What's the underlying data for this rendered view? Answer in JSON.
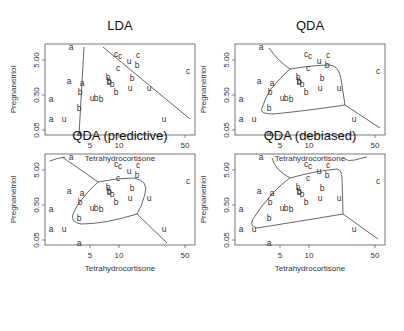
{
  "chart_data": [
    {
      "type": "scatter",
      "title": "LDA",
      "xlabel": "Tetrahydrocortisone",
      "ylabel": "Pregnanetriol",
      "xscale": "log",
      "yscale": "log",
      "xticks": [
        "5",
        "10",
        "50"
      ],
      "yticks": [
        "0.05",
        "0.50",
        "5.00"
      ],
      "xlim": [
        1.7,
        63
      ],
      "ylim": [
        0.04,
        14
      ],
      "boundary_type": "linear"
    },
    {
      "type": "scatter",
      "title": "QDA",
      "xlabel": "Tetrahydrocortisone",
      "ylabel": "Pregnanetriol",
      "xscale": "log",
      "yscale": "log",
      "xticks": [
        "5",
        "10",
        "50"
      ],
      "yticks": [
        "0.05",
        "0.50",
        "5.00"
      ],
      "boundary_type": "quadratic"
    },
    {
      "type": "scatter",
      "title": "QDA (predictive)",
      "xlabel": "Tetrahydrocortisone",
      "ylabel": "Pregnanetriol",
      "xscale": "log",
      "yscale": "log",
      "xticks": [
        "5",
        "10",
        "50"
      ],
      "yticks": [
        "0.05",
        "0.50",
        "5.00"
      ],
      "boundary_type": "quadratic-predictive"
    },
    {
      "type": "scatter",
      "title": "QDA (debiased)",
      "xlabel": "Tetrahydrocortisone",
      "ylabel": "Pregnanetriol",
      "xscale": "log",
      "yscale": "log",
      "xticks": [
        "5",
        "10",
        "50"
      ],
      "yticks": [
        "0.05",
        "0.50",
        "5.00"
      ],
      "boundary_type": "quadratic-debiased"
    }
  ],
  "points": [
    {
      "l": "a",
      "x": 26,
      "y": 3
    },
    {
      "l": "a",
      "x": 24,
      "y": 37
    },
    {
      "l": "a",
      "x": 37,
      "y": 39
    },
    {
      "l": "b",
      "x": 35,
      "y": 48
    },
    {
      "l": "a",
      "x": 6,
      "y": 55
    },
    {
      "l": "b",
      "x": 34,
      "y": 64
    },
    {
      "l": "a",
      "x": 6,
      "y": 75
    },
    {
      "l": "u",
      "x": 19,
      "y": 75
    },
    {
      "l": "a",
      "x": 34,
      "y": 89
    },
    {
      "l": "u",
      "x": 47,
      "y": 54
    },
    {
      "l": "b",
      "x": 51,
      "y": 54
    },
    {
      "l": "b",
      "x": 56,
      "y": 55
    },
    {
      "l": "b",
      "x": 63,
      "y": 33
    },
    {
      "l": "b",
      "x": 64,
      "y": 37
    },
    {
      "l": "b",
      "x": 64,
      "y": 38
    },
    {
      "l": "b",
      "x": 67,
      "y": 40
    },
    {
      "l": "b",
      "x": 71,
      "y": 48
    },
    {
      "l": "c",
      "x": 71,
      "y": 10
    },
    {
      "l": "c",
      "x": 75,
      "y": 12
    },
    {
      "l": "u",
      "x": 84,
      "y": 17
    },
    {
      "l": "c",
      "x": 93,
      "y": 11
    },
    {
      "l": "b",
      "x": 92,
      "y": 21
    },
    {
      "l": "c",
      "x": 73,
      "y": 24
    },
    {
      "l": "b",
      "x": 87,
      "y": 34
    },
    {
      "l": "u",
      "x": 85,
      "y": 44
    },
    {
      "l": "u",
      "x": 104,
      "y": 44
    },
    {
      "l": "c",
      "x": 143,
      "y": 27
    },
    {
      "l": "u",
      "x": 119,
      "y": 75
    }
  ],
  "panels": [
    {
      "title": "LDA",
      "ox": 45,
      "oy": 44,
      "paths": [
        "M 39 3 L 34 91",
        "M 58 3 L 145 75"
      ]
    },
    {
      "title": "QDA",
      "ox": 235,
      "oy": 44,
      "paths": [
        "M 34 4 Q 44 18 55 25",
        "M 55 25 Q 80 21 95 21 Q 104 22 106 35 L 110 61 Q 70 67 38 70 Q 24 70 27 64 Q 30 55 35 46 Q 45 34 55 25",
        "M 110 61 L 145 84"
      ]
    },
    {
      "title": "QDA (predictive)",
      "ox": 45,
      "oy": 154,
      "paths": [
        "M 5 7 Q 12 4 20 3",
        "M 17 3 Q 35 15 53 28",
        "M 53 28 Q 72 24 88 24 Q 104 26 100 40 Q 97 52 92 60 Q 60 70 36 70 Q 25 68 28 60 Q 32 50 38 44 Q 45 35 53 28",
        "M 92 60 L 122 89"
      ]
    },
    {
      "title": "QDA (debiased)",
      "ox": 235,
      "oy": 154,
      "paths": [
        "M 37 4 Q 40 16 55 24",
        "M 55 24 Q 80 17 102 15 Q 107 16 107 24 L 108 60 Q 60 68 22 74 Q 14 72 18 65 Q 26 52 38 39 Q 46 30 55 24",
        "M 108 60 L 143 85",
        "M 108 4 Q 113 8 120 6 Q 126 4 132 3"
      ]
    }
  ],
  "frame": {
    "w": 150,
    "h": 91
  },
  "xtick_pos": [
    45,
    74,
    140
  ],
  "ytick_pos": [
    16,
    51,
    86
  ]
}
